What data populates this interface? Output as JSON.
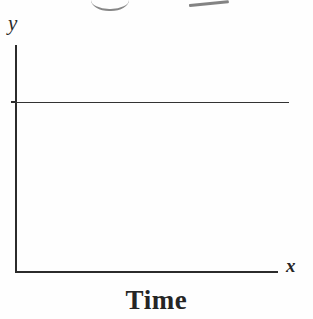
{
  "chart_data": {
    "type": "line",
    "title": "",
    "subtitle": "",
    "xlabel": "Time",
    "ylabel": "",
    "x_axis_symbol": "x",
    "y_axis_symbol": "y",
    "grid": false,
    "legend": null,
    "legend_position": "none",
    "xlim": [
      0,
      1
    ],
    "ylim": [
      0,
      1
    ],
    "x_tick_labels": [],
    "y_tick_labels": [],
    "series": [
      {
        "name": "constant level",
        "description": "horizontal straight line at a constant y value spanning the full width of the plot",
        "x": [
          0.0,
          1.0
        ],
        "values": [
          0.75,
          0.75
        ]
      }
    ],
    "annotations": [
      {
        "name": "y-axis-symbol",
        "text": "y",
        "style": "italic-serif",
        "position": "top-left of vertical axis"
      },
      {
        "name": "x-axis-symbol",
        "text": "x",
        "style": "italic-serif",
        "position": "right end of horizontal axis"
      },
      {
        "name": "x-axis-caption",
        "text": "Time",
        "style": "bold-serif",
        "position": "below plot, centered"
      }
    ],
    "artifacts": [
      {
        "name": "top-curve-stroke",
        "description": "faint cut-off curved pen stroke at the very top of the scan"
      },
      {
        "name": "top-slash-stroke",
        "description": "faint cut-off slanted pen stroke at the very top of the scan"
      }
    ]
  },
  "figure": {
    "caption": "Time",
    "axis": {
      "y_symbol": "y",
      "x_symbol": "x"
    },
    "colors": {
      "background": "#fefefe",
      "axis": "#2b2b2b",
      "series": "#333333",
      "text": "#252525",
      "artifact": "#6d6d6d"
    }
  }
}
